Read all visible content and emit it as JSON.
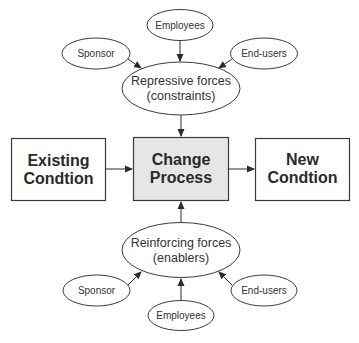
{
  "diagram": {
    "top_group": {
      "employees": "Employees",
      "sponsor": "Sponsor",
      "end_users": "End-users",
      "forces_line1": "Repressive forces",
      "forces_line2": "(constraints)"
    },
    "process_row": {
      "existing_line1": "Existing",
      "existing_line2": "Condtion",
      "change_line1": "Change",
      "change_line2": "Process",
      "new_line1": "New",
      "new_line2": "Condtion"
    },
    "bottom_group": {
      "forces_line1": "Reinforcing forces",
      "forces_line2": "(enablers)",
      "sponsor": "Sponsor",
      "end_users": "End-users",
      "employees": "Employees"
    },
    "colors": {
      "center_box_fill": "#e6e6e6",
      "stroke": "#3a3a3a"
    }
  }
}
